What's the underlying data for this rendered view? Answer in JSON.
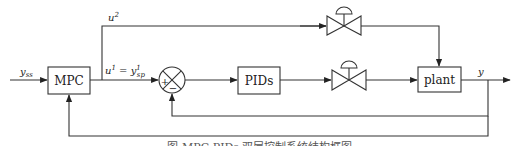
{
  "diagram": {
    "blocks": {
      "mpc": "MPC",
      "pids": "PIDs",
      "plant": "plant"
    },
    "signals": {
      "input": "y",
      "input_sub": "ss",
      "upper_branch": "u",
      "upper_branch_sup": "2",
      "lower_branch_lhs": "u",
      "lower_branch_lhs_sup": "1",
      "lower_branch_eq": " = ",
      "lower_branch_rhs": "y",
      "lower_branch_rhs_sup": "1",
      "lower_branch_rhs_sub": "sp",
      "output": "y"
    },
    "summing_junction": {
      "plus_sign": "+",
      "minus_sign": "−"
    },
    "valves": [
      "control-valve-upper",
      "control-valve-lower"
    ],
    "caption": "图 MPC-PIDs 双层控制系统结构框图"
  }
}
